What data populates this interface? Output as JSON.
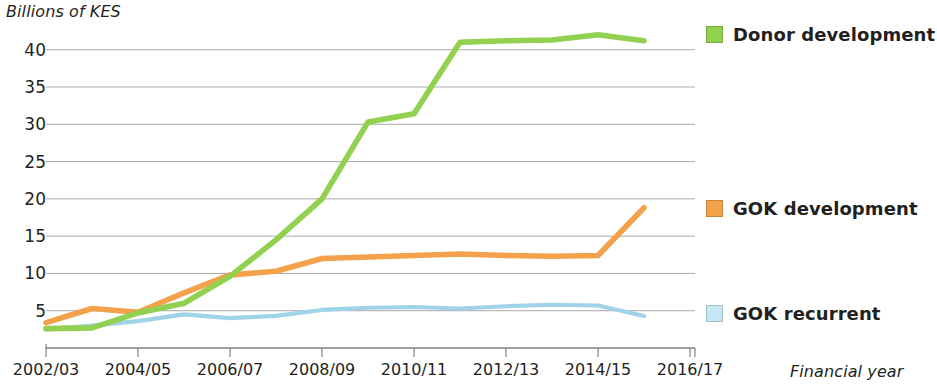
{
  "chart_data": {
    "type": "line",
    "title": "",
    "ylabel": "Billions of KES",
    "xlabel": "Financial year",
    "ylim": [
      0,
      42.5
    ],
    "yticks": [
      5,
      10,
      15,
      20,
      25,
      30,
      35,
      40
    ],
    "grid": true,
    "legend_position": "right",
    "x": [
      "2002/03",
      "2003/04",
      "2004/05",
      "2005/06",
      "2006/07",
      "2007/08",
      "2008/09",
      "2009/10",
      "2010/11",
      "2011/12",
      "2012/13",
      "2013/14",
      "2014/15",
      "2015/16"
    ],
    "xticks": [
      "2002/03",
      "2004/05",
      "2006/07",
      "2008/09",
      "2010/11",
      "2012/13",
      "2014/15",
      "2016/17"
    ],
    "series": [
      {
        "name": "Donor development",
        "color": "#92d050",
        "values": [
          2.6,
          2.7,
          4.7,
          6.0,
          9.6,
          14.5,
          20.0,
          30.3,
          31.4,
          41.0,
          41.2,
          41.3,
          42.0,
          41.2
        ]
      },
      {
        "name": "GOK development",
        "color": "#f4a14b",
        "values": [
          3.4,
          5.3,
          4.8,
          7.4,
          9.8,
          10.3,
          12.0,
          12.2,
          12.4,
          12.6,
          12.4,
          12.3,
          12.4,
          18.8
        ]
      },
      {
        "name": "GOK recurrent",
        "color": "#9ed3e8",
        "values": [
          2.5,
          3.0,
          3.6,
          4.5,
          4.0,
          4.3,
          5.1,
          5.4,
          5.5,
          5.3,
          5.6,
          5.8,
          5.7,
          4.3
        ]
      }
    ]
  },
  "legend": {
    "items": [
      {
        "label": "Donor development",
        "swatch": "#92d050"
      },
      {
        "label": "GOK development",
        "swatch": "#f4a14b"
      },
      {
        "label": "GOK recurrent",
        "swatch": "#c7e8f2"
      }
    ]
  },
  "axes": {
    "y_title": "Billions of KES",
    "x_title": "Financial year",
    "y_labels": [
      "40",
      "35",
      "30",
      "25",
      "20",
      "15",
      "10",
      "5"
    ],
    "x_labels": [
      "2002/03",
      "2004/05",
      "2006/07",
      "2008/09",
      "2010/11",
      "2012/13",
      "2014/15",
      "2016/17"
    ]
  },
  "colors": {
    "grid": "#a7a9ac",
    "axis": "#808285",
    "text": "#231f20",
    "green": "#92d050",
    "orange": "#f4a14b",
    "blue": "#9ed3e8",
    "blue_swatch": "#c7e8f2"
  }
}
